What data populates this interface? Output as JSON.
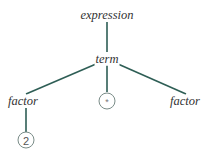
{
  "diagram": {
    "type": "parse-tree",
    "colors": {
      "edge": "#2e5e55",
      "label_text": "#333333",
      "leaf_border": "#7a8c88",
      "leaf_text": "#555555",
      "background": "#ffffff"
    },
    "nodes": {
      "root": {
        "label": "expression"
      },
      "term": {
        "label": "term"
      },
      "factor_left": {
        "label": "factor"
      },
      "operator": {
        "label": "*"
      },
      "factor_right": {
        "label": "factor"
      },
      "literal": {
        "label": "2"
      }
    },
    "edges": [
      {
        "from": "expression",
        "to": "term"
      },
      {
        "from": "term",
        "to": "factor"
      },
      {
        "from": "term",
        "to": "*"
      },
      {
        "from": "term",
        "to": "factor"
      },
      {
        "from": "factor",
        "to": "2"
      }
    ]
  }
}
